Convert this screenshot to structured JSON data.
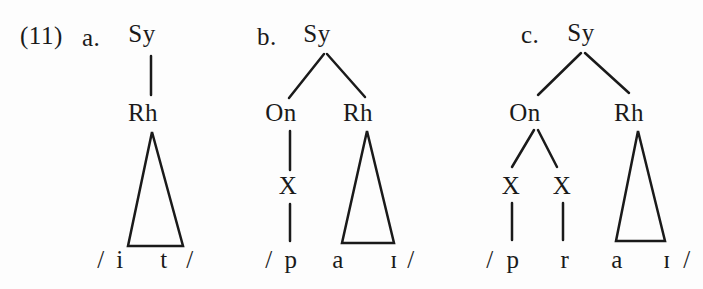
{
  "figure_label": "(11)",
  "trees": [
    {
      "item_label": "a.",
      "nodes": {
        "root": "Sy",
        "rhyme": "Rh"
      },
      "transcription": {
        "open_slash": "/",
        "segments": [
          "i",
          "t"
        ],
        "close_slash": "/"
      }
    },
    {
      "item_label": "b.",
      "nodes": {
        "root": "Sy",
        "onset": "On",
        "rhyme": "Rh",
        "x1": "X"
      },
      "transcription": {
        "open_slash": "/",
        "segments": [
          "p",
          "a",
          "ɪ"
        ],
        "close_slash": "/"
      }
    },
    {
      "item_label": "c.",
      "nodes": {
        "root": "Sy",
        "onset": "On",
        "rhyme": "Rh",
        "x1": "X",
        "x2": "X"
      },
      "transcription": {
        "open_slash": "/",
        "segments": [
          "p",
          "r",
          "a",
          "ɪ"
        ],
        "close_slash": "/"
      }
    }
  ],
  "colors": {
    "background": "#fdfdfd",
    "ink": "#1a1a1a"
  }
}
